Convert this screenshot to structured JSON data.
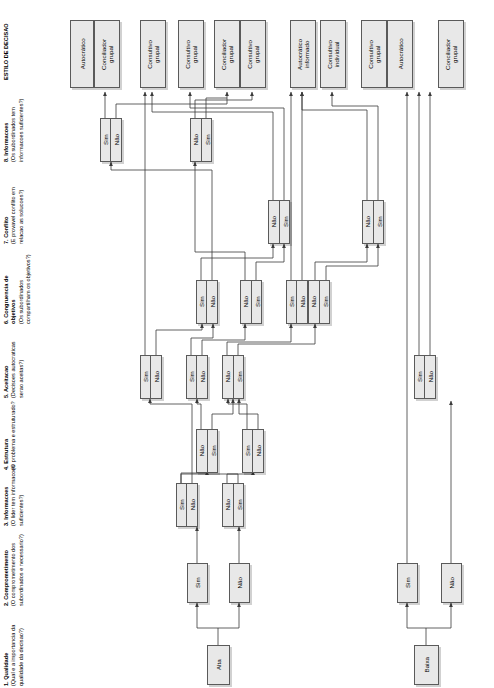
{
  "diagram": {
    "orientation": "rotated-90",
    "language": "pt-BR",
    "colors": {
      "node_fill": "#e8e8e8",
      "node_border": "#5a5a5a",
      "wire": "#3a3a3a",
      "background": "#ffffff"
    }
  },
  "columns": [
    {
      "id": "c1",
      "title": "1. Qualidade",
      "subtitle": "(Qual e a importancia da qualidade da decisao?)"
    },
    {
      "id": "c2",
      "title": "2. Comprometimento",
      "subtitle": "(O comprometimento dos subordinados e necessario?)"
    },
    {
      "id": "c3",
      "title": "3. Informacoes",
      "subtitle": "(O lider tem informacoes suficientes?)"
    },
    {
      "id": "c4",
      "title": "4. Estrutura",
      "subtitle": "(O problema e estruturado?"
    },
    {
      "id": "c5",
      "title": "5. Aceitacao",
      "subtitle": "(Decisoes autocraticas serao aceitas?)"
    },
    {
      "id": "c6",
      "title": "6. Congruencia de objetivos",
      "subtitle": "(Os subordinados compartilham os objetivos?)"
    },
    {
      "id": "c7",
      "title": "7. Conflito",
      "subtitle": "(E provavel conflito em relacao as solucoes?)"
    },
    {
      "id": "c8",
      "title": "8. Informacoes",
      "subtitle": "(Os subordinados tem informacoes suficientes?)"
    },
    {
      "id": "c9",
      "title": "ESTILO DE DECISAO",
      "subtitle": ""
    }
  ],
  "labels": {
    "sim": "Sim",
    "nao": "Não",
    "alta": "Alta",
    "baixa": "Baixa"
  },
  "roots": [
    {
      "id": "alta",
      "label": "Alta",
      "x": 206,
      "y": 645,
      "w": 24,
      "h": 40
    },
    {
      "id": "baixa",
      "label": "Baixa",
      "x": 414,
      "y": 645,
      "w": 24,
      "h": 40
    }
  ],
  "decision_nodes": [
    {
      "id": "d1",
      "col": "c2",
      "x": 186,
      "y": 563,
      "w": 22,
      "h": 38,
      "cells": [
        "Sim"
      ]
    },
    {
      "id": "d2",
      "col": "c2",
      "x": 228,
      "y": 563,
      "w": 22,
      "h": 38,
      "cells": [
        "Não"
      ]
    },
    {
      "id": "d3",
      "col": "c2",
      "x": 396,
      "y": 563,
      "w": 22,
      "h": 38,
      "cells": [
        "Sim"
      ]
    },
    {
      "id": "d4",
      "col": "c2",
      "x": 440,
      "y": 563,
      "w": 22,
      "h": 38,
      "cells": [
        "Não"
      ]
    },
    {
      "id": "d5",
      "col": "c3",
      "x": 176,
      "y": 483,
      "w": 22,
      "h": 42,
      "cells": [
        "Sim",
        "Não"
      ]
    },
    {
      "id": "d6",
      "col": "c3",
      "x": 222,
      "y": 483,
      "w": 22,
      "h": 42,
      "cells": [
        "Não",
        "Sim"
      ]
    },
    {
      "id": "d7",
      "col": "c4",
      "x": 196,
      "y": 429,
      "w": 22,
      "h": 42,
      "cells": [
        "Não",
        "Sim"
      ]
    },
    {
      "id": "d8",
      "col": "c4",
      "x": 242,
      "y": 429,
      "w": 22,
      "h": 42,
      "cells": [
        "Sim",
        "Não"
      ]
    },
    {
      "id": "d9",
      "col": "c5",
      "x": 140,
      "y": 355,
      "w": 22,
      "h": 42,
      "cells": [
        "Sim",
        "Não"
      ]
    },
    {
      "id": "d10",
      "col": "c5",
      "x": 186,
      "y": 355,
      "w": 22,
      "h": 42,
      "cells": [
        "Sim",
        "Não"
      ]
    },
    {
      "id": "d11",
      "col": "c5",
      "x": 222,
      "y": 355,
      "w": 22,
      "h": 42,
      "cells": [
        "Não",
        "Sim"
      ]
    },
    {
      "id": "d12",
      "col": "c5",
      "x": 414,
      "y": 355,
      "w": 22,
      "h": 42,
      "cells": [
        "Sim",
        "Não"
      ]
    },
    {
      "id": "d13",
      "col": "c6",
      "x": 196,
      "y": 280,
      "w": 22,
      "h": 42,
      "cells": [
        "Sim",
        "Não"
      ]
    },
    {
      "id": "d14",
      "col": "c6",
      "x": 240,
      "y": 280,
      "w": 22,
      "h": 42,
      "cells": [
        "Não",
        "Sim"
      ]
    },
    {
      "id": "d15",
      "col": "c6",
      "x": 286,
      "y": 280,
      "w": 22,
      "h": 42,
      "cells": [
        "Sim",
        "Não"
      ]
    },
    {
      "id": "d16",
      "col": "c6",
      "x": 310,
      "y": 280,
      "w": 22,
      "h": 42,
      "cells": [
        "Não",
        "Sim"
      ]
    },
    {
      "id": "d17",
      "col": "c7",
      "x": 268,
      "y": 200,
      "w": 22,
      "h": 42,
      "cells": [
        "Não",
        "Sim"
      ]
    },
    {
      "id": "d18",
      "col": "c7",
      "x": 362,
      "y": 200,
      "w": 22,
      "h": 42,
      "cells": [
        "Não",
        "Sim"
      ]
    },
    {
      "id": "d19",
      "col": "c8",
      "x": 100,
      "y": 118,
      "w": 22,
      "h": 42,
      "cells": [
        "Sim",
        "Não"
      ]
    },
    {
      "id": "d20",
      "col": "c8",
      "x": 190,
      "y": 118,
      "w": 22,
      "h": 42,
      "cells": [
        "Não",
        "Sim"
      ]
    }
  ],
  "outcomes": [
    {
      "id": "o1",
      "x": 70,
      "y": 20,
      "w": 24,
      "h": 68,
      "label": "Autocrático"
    },
    {
      "id": "o2",
      "x": 95,
      "y": 20,
      "w": 24,
      "h": 68,
      "label": "Conciliador\ngrupal"
    },
    {
      "id": "o3",
      "x": 140,
      "y": 20,
      "w": 24,
      "h": 68,
      "label": "Consultivo\ngrupal"
    },
    {
      "id": "o4",
      "x": 178,
      "y": 20,
      "w": 24,
      "h": 68,
      "label": "Consultivo\ngrupal"
    },
    {
      "id": "o5",
      "x": 215,
      "y": 20,
      "w": 24,
      "h": 68,
      "label": "Conciliador\ngrupal"
    },
    {
      "id": "o6",
      "x": 240,
      "y": 20,
      "w": 24,
      "h": 68,
      "label": "Consultivo\ngrupal"
    },
    {
      "id": "o7",
      "x": 290,
      "y": 20,
      "w": 24,
      "h": 68,
      "label": "Autocrático\ninformado"
    },
    {
      "id": "o8",
      "x": 320,
      "y": 20,
      "w": 24,
      "h": 68,
      "label": "Consultivo\nindividual"
    },
    {
      "id": "o9",
      "x": 362,
      "y": 20,
      "w": 24,
      "h": 68,
      "label": "Consultivo\ngrupal"
    },
    {
      "id": "o10",
      "x": 387,
      "y": 20,
      "w": 24,
      "h": 68,
      "label": "Autocrático"
    },
    {
      "id": "o11",
      "x": 440,
      "y": 20,
      "w": 24,
      "h": 68,
      "label": "Conciliador\ngrupal"
    }
  ]
}
